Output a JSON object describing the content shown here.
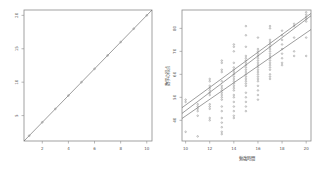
{
  "chart_data": [
    {
      "type": "scatter",
      "title": "",
      "xlabel": "",
      "ylabel": "",
      "xticks": [
        2,
        4,
        6,
        8,
        10
      ],
      "yticks": [
        5,
        10,
        15,
        20
      ],
      "xlim": [
        0.6,
        10.4
      ],
      "ylim": [
        1.2,
        20.8
      ],
      "grid": false,
      "legend": null,
      "series": [
        {
          "name": "points",
          "x": [
            1,
            2,
            3,
            4,
            5,
            6,
            7,
            8,
            9,
            10
          ],
          "y": [
            2,
            4,
            6,
            8,
            10,
            12,
            14,
            16,
            18,
            20
          ]
        }
      ],
      "lines": [
        {
          "name": "fit",
          "x": [
            0.6,
            10.4
          ],
          "y": [
            1.2,
            20.8
          ]
        }
      ]
    },
    {
      "type": "scatter",
      "title": "",
      "xlabel": "勉強時間",
      "ylabel": "数学の得点",
      "xticks": [
        10,
        12,
        14,
        16,
        18,
        20
      ],
      "yticks": [
        40,
        50,
        60,
        70,
        80
      ],
      "xlim": [
        9.7,
        20.4
      ],
      "ylim": [
        31,
        88
      ],
      "grid": false,
      "legend": null,
      "series": [
        {
          "name": "scores",
          "points": [
            [
              10,
              49
            ],
            [
              10,
              48
            ],
            [
              10,
              35
            ],
            [
              11,
              47
            ],
            [
              11,
              46
            ],
            [
              11,
              45
            ],
            [
              11,
              44
            ],
            [
              11,
              42
            ],
            [
              11,
              33
            ],
            [
              12,
              58
            ],
            [
              12,
              57
            ],
            [
              12,
              55
            ],
            [
              12,
              54
            ],
            [
              12,
              53
            ],
            [
              12,
              52
            ],
            [
              12,
              51
            ],
            [
              12,
              47
            ],
            [
              12,
              46
            ],
            [
              12,
              45
            ],
            [
              12,
              41
            ],
            [
              12,
              40
            ],
            [
              13,
              66
            ],
            [
              13,
              65
            ],
            [
              13,
              62
            ],
            [
              13,
              61
            ],
            [
              13,
              57
            ],
            [
              13,
              55
            ],
            [
              13,
              54
            ],
            [
              13,
              53
            ],
            [
              13,
              52
            ],
            [
              13,
              51
            ],
            [
              13,
              50
            ],
            [
              13,
              49
            ],
            [
              13,
              46
            ],
            [
              13,
              44
            ],
            [
              13,
              41
            ],
            [
              13,
              39
            ],
            [
              13,
              37
            ],
            [
              13,
              35
            ],
            [
              13,
              34
            ],
            [
              14,
              73
            ],
            [
              14,
              72
            ],
            [
              14,
              70
            ],
            [
              14,
              65
            ],
            [
              14,
              63
            ],
            [
              14,
              62
            ],
            [
              14,
              61
            ],
            [
              14,
              60
            ],
            [
              14,
              59
            ],
            [
              14,
              58
            ],
            [
              14,
              57
            ],
            [
              14,
              56
            ],
            [
              14,
              55
            ],
            [
              14,
              54
            ],
            [
              14,
              53
            ],
            [
              14,
              51
            ],
            [
              14,
              50
            ],
            [
              14,
              48
            ],
            [
              14,
              46
            ],
            [
              14,
              44
            ],
            [
              14,
              42
            ],
            [
              14,
              41
            ],
            [
              15,
              81
            ],
            [
              15,
              77
            ],
            [
              15,
              72
            ],
            [
              15,
              68
            ],
            [
              15,
              67
            ],
            [
              15,
              66
            ],
            [
              15,
              65
            ],
            [
              15,
              64
            ],
            [
              15,
              63
            ],
            [
              15,
              62
            ],
            [
              15,
              61
            ],
            [
              15,
              60
            ],
            [
              15,
              59
            ],
            [
              15,
              58
            ],
            [
              15,
              57
            ],
            [
              15,
              56
            ],
            [
              15,
              55
            ],
            [
              15,
              52
            ],
            [
              15,
              50
            ],
            [
              15,
              48
            ],
            [
              15,
              46
            ],
            [
              15,
              44
            ],
            [
              16,
              76
            ],
            [
              16,
              71
            ],
            [
              16,
              70
            ],
            [
              16,
              69
            ],
            [
              16,
              68
            ],
            [
              16,
              67
            ],
            [
              16,
              66
            ],
            [
              16,
              65
            ],
            [
              16,
              64
            ],
            [
              16,
              63
            ],
            [
              16,
              62
            ],
            [
              16,
              61
            ],
            [
              16,
              60
            ],
            [
              16,
              59
            ],
            [
              16,
              58
            ],
            [
              16,
              57
            ],
            [
              16,
              55
            ],
            [
              16,
              53
            ],
            [
              16,
              51
            ],
            [
              16,
              49
            ],
            [
              17,
              81
            ],
            [
              17,
              80
            ],
            [
              17,
              75
            ],
            [
              17,
              74
            ],
            [
              17,
              73
            ],
            [
              17,
              72
            ],
            [
              17,
              71
            ],
            [
              17,
              70
            ],
            [
              17,
              69
            ],
            [
              17,
              68
            ],
            [
              17,
              67
            ],
            [
              17,
              66
            ],
            [
              17,
              65
            ],
            [
              17,
              64
            ],
            [
              17,
              63
            ],
            [
              17,
              62
            ],
            [
              17,
              60
            ],
            [
              17,
              59
            ],
            [
              17,
              58
            ],
            [
              18,
              79
            ],
            [
              18,
              77
            ],
            [
              18,
              75
            ],
            [
              18,
              73
            ],
            [
              18,
              71
            ],
            [
              18,
              69
            ],
            [
              18,
              67
            ],
            [
              18,
              65
            ],
            [
              18,
              64
            ],
            [
              19,
              82
            ],
            [
              19,
              81
            ],
            [
              19,
              76
            ],
            [
              19,
              70
            ],
            [
              19,
              68
            ],
            [
              20,
              87
            ],
            [
              20,
              86
            ],
            [
              20,
              85
            ],
            [
              20,
              84
            ],
            [
              20,
              83
            ],
            [
              20,
              76
            ],
            [
              20,
              68
            ]
          ]
        }
      ],
      "lines": [
        {
          "name": "upper-fit",
          "x": [
            9.7,
            20.4
          ],
          "y": [
            45.5,
            86.5
          ]
        },
        {
          "name": "middle-fit",
          "x": [
            9.7,
            20.4
          ],
          "y": [
            43.0,
            85.5
          ]
        },
        {
          "name": "lower-fit",
          "x": [
            9.7,
            20.4
          ],
          "y": [
            40.8,
            79.5
          ]
        }
      ]
    }
  ],
  "plots": {
    "left": {
      "xticks": [
        "2",
        "4",
        "6",
        "8",
        "10"
      ],
      "yticks": [
        "5",
        "10",
        "15",
        "20"
      ]
    },
    "right": {
      "xticks": [
        "10",
        "12",
        "14",
        "16",
        "18",
        "20"
      ],
      "yticks": [
        "40",
        "50",
        "60",
        "70",
        "80"
      ],
      "xlabel": "勉強時間",
      "ylabel": "数学の得点"
    }
  }
}
